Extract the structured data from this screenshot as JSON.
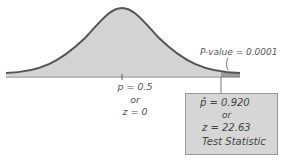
{
  "diagram": {
    "type": "normal-distribution-test-statistic",
    "colors": {
      "curve_fill": "#d3d3d3",
      "curve_stroke": "#555555",
      "tail_fill": "#9e9e9e",
      "box_fill": "#d6d6d6"
    },
    "center_labels": {
      "line1": "p = 0.5",
      "line2": "or",
      "line3": "z = 0"
    },
    "pvalue_label": "P-value = 0.0001",
    "test_statistic_box": {
      "line1": "p̂ = 0.920",
      "line2": "or",
      "line3": "z = 22.63",
      "line4": "Test Statistic"
    }
  }
}
